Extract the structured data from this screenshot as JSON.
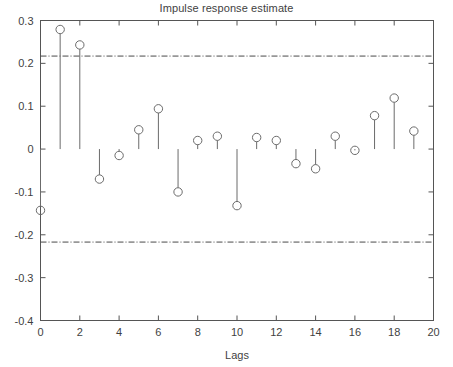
{
  "chart_data": {
    "type": "scatter",
    "subtype": "stem",
    "title": "Impulse response estimate",
    "xlabel": "Lags",
    "ylabel": "",
    "xlim": [
      0,
      20
    ],
    "ylim": [
      -0.4,
      0.3
    ],
    "xticks": [
      0,
      2,
      4,
      6,
      8,
      10,
      12,
      14,
      16,
      18,
      20
    ],
    "xtick_labels": [
      "0",
      "2",
      "4",
      "6",
      "8",
      "10",
      "12",
      "14",
      "16",
      "18",
      "20"
    ],
    "yticks": [
      -0.4,
      -0.3,
      -0.2,
      -0.1,
      0,
      0.1,
      0.2,
      0.3
    ],
    "ytick_labels": [
      "-0.4",
      "-0.3",
      "-0.2",
      "-0.1",
      "0",
      "0.1",
      "0.2",
      "0.3"
    ],
    "grid": false,
    "legend": null,
    "marker": "open-circle",
    "baseline": 0,
    "x": [
      0,
      1,
      2,
      3,
      4,
      5,
      6,
      7,
      8,
      9,
      10,
      11,
      12,
      13,
      14,
      15,
      16,
      17,
      18,
      19
    ],
    "values": [
      -0.143,
      0.279,
      0.243,
      -0.07,
      -0.015,
      0.045,
      0.094,
      -0.1,
      0.02,
      0.03,
      -0.132,
      0.027,
      0.02,
      -0.034,
      -0.046,
      0.03,
      -0.003,
      0.078,
      0.119,
      0.042
    ],
    "confidence_bounds": {
      "upper": 0.217,
      "lower": -0.217,
      "style": "dash-dot"
    },
    "colors": {
      "axis": "#555555",
      "stem": "#6b6b6b",
      "marker": "#6b6b6b",
      "confidence": "#4a4a4a",
      "background": "#ffffff",
      "text": "#3f3f3f"
    }
  }
}
